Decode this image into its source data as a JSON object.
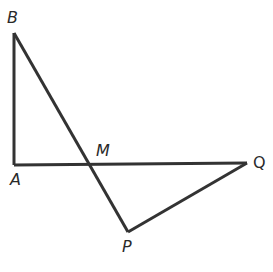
{
  "diagram": {
    "type": "geometry",
    "stroke_color": "#333333",
    "points": {
      "B": {
        "label": "B",
        "x": 14,
        "y": 33
      },
      "A": {
        "label": "A",
        "x": 14,
        "y": 165
      },
      "M": {
        "label": "M",
        "x": 89,
        "y": 164
      },
      "Q": {
        "label": "Q",
        "x": 247,
        "y": 163
      },
      "P": {
        "label": "P",
        "x": 128,
        "y": 232
      }
    },
    "segments": [
      [
        "B",
        "A"
      ],
      [
        "A",
        "Q"
      ],
      [
        "B",
        "P"
      ],
      [
        "P",
        "Q"
      ]
    ]
  }
}
